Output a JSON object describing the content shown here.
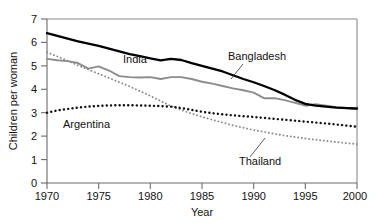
{
  "chart_data": {
    "type": "line",
    "title": "",
    "xlabel": "Year",
    "ylabel": "Children per woman",
    "xlim": [
      1970,
      2000
    ],
    "ylim": [
      0,
      7
    ],
    "xticks": [
      1970,
      1975,
      1980,
      1985,
      1990,
      1995,
      2000
    ],
    "yticks": [
      0,
      1,
      2,
      3,
      4,
      5,
      6,
      7
    ],
    "grid": false,
    "legend_position": "inline-annotations",
    "x": [
      1970,
      1971,
      1972,
      1973,
      1974,
      1975,
      1976,
      1977,
      1978,
      1979,
      1980,
      1981,
      1982,
      1983,
      1984,
      1985,
      1986,
      1987,
      1988,
      1989,
      1990,
      1991,
      1992,
      1993,
      1994,
      1995,
      1996,
      1997,
      1998,
      1999,
      2000
    ],
    "series": [
      {
        "name": "India",
        "style": "solid",
        "color": "#000000",
        "values": [
          6.4,
          6.28,
          6.16,
          6.05,
          5.95,
          5.85,
          5.74,
          5.62,
          5.5,
          5.42,
          5.32,
          5.23,
          5.3,
          5.25,
          5.12,
          5.0,
          4.88,
          4.76,
          4.6,
          4.44,
          4.3,
          4.14,
          3.97,
          3.77,
          3.55,
          3.38,
          3.3,
          3.26,
          3.22,
          3.2,
          3.18
        ]
      },
      {
        "name": "Bangladesh",
        "style": "solid",
        "color": "#8c8c8c",
        "values": [
          5.3,
          5.24,
          5.2,
          5.12,
          4.88,
          4.98,
          4.8,
          4.56,
          4.52,
          4.5,
          4.52,
          4.44,
          4.52,
          4.52,
          4.44,
          4.32,
          4.24,
          4.14,
          4.04,
          3.96,
          3.86,
          3.62,
          3.62,
          3.54,
          3.42,
          3.3,
          3.36,
          3.3,
          3.24,
          3.2,
          3.16
        ]
      },
      {
        "name": "Argentina",
        "style": "dotted",
        "color": "#111111",
        "values": [
          3.0,
          3.1,
          3.16,
          3.22,
          3.26,
          3.29,
          3.31,
          3.32,
          3.32,
          3.31,
          3.3,
          3.28,
          3.26,
          3.2,
          3.12,
          3.04,
          2.98,
          2.93,
          2.89,
          2.85,
          2.82,
          2.78,
          2.74,
          2.7,
          2.66,
          2.62,
          2.58,
          2.54,
          2.5,
          2.45,
          2.4
        ]
      },
      {
        "name": "Thailand",
        "style": "dotted",
        "color": "#8a8a8a",
        "values": [
          5.58,
          5.4,
          5.22,
          5.02,
          4.84,
          4.66,
          4.48,
          4.3,
          4.12,
          3.92,
          3.72,
          3.5,
          3.28,
          3.12,
          2.96,
          2.82,
          2.7,
          2.58,
          2.46,
          2.36,
          2.26,
          2.18,
          2.1,
          2.02,
          1.96,
          1.9,
          1.85,
          1.8,
          1.75,
          1.7,
          1.66
        ]
      }
    ],
    "annotations": [
      {
        "text": "India",
        "for": "India",
        "leader": false
      },
      {
        "text": "Bangladesh",
        "for": "Bangladesh",
        "leader": true
      },
      {
        "text": "Argentina",
        "for": "Argentina",
        "leader": false
      },
      {
        "text": "Thailand",
        "for": "Thailand",
        "leader": true
      }
    ]
  }
}
